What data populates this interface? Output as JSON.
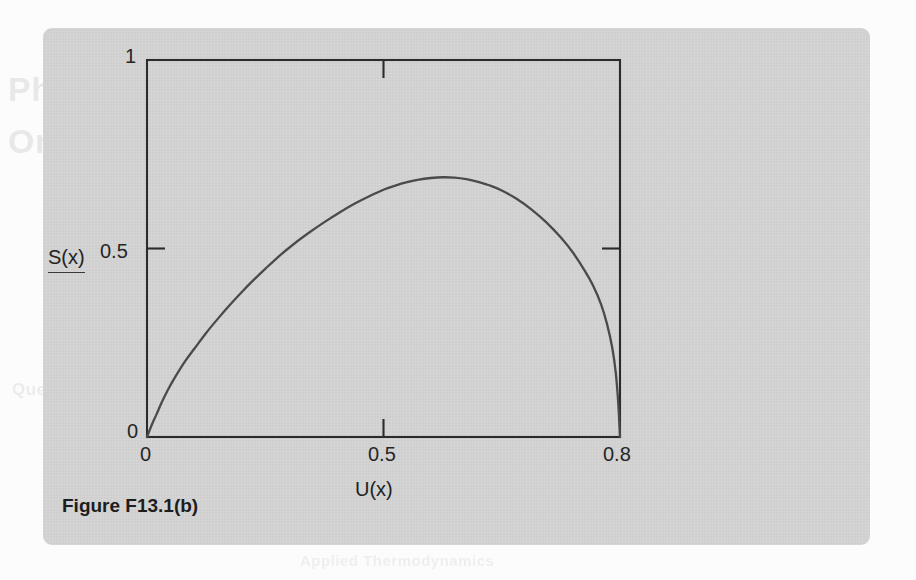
{
  "page": {
    "background_color": "#fdfdfd",
    "card_color": "#d4d4d4",
    "ghost_text": {
      "line_1": "Phase diagrams",
      "line_2": "One-component systems",
      "line_3": "Question 13.1",
      "line_4": "Applied Thermodynamics"
    }
  },
  "caption": {
    "text": "Figure F13.1(b)"
  },
  "chart_data": {
    "type": "line",
    "title": "",
    "subtitle": "",
    "xlabel": "U(x)",
    "ylabel": "S(x)",
    "xlim": [
      0,
      0.8
    ],
    "ylim": [
      0,
      1
    ],
    "grid": false,
    "legend": null,
    "axis_color": "#2b2b2b",
    "curve_color": "#4a4a4a",
    "xticks": [
      {
        "value": 0,
        "label": "0"
      },
      {
        "value": 0.5,
        "label": "0.5"
      },
      {
        "value": 0.8,
        "label": "0.8"
      }
    ],
    "yticks": [
      {
        "value": 0,
        "label": "0"
      },
      {
        "value": 0.5,
        "label": "0.5"
      },
      {
        "value": 1,
        "label": "1"
      }
    ],
    "tick_marks": {
      "top_center": 0.5,
      "right_middle": 0.5,
      "bottom_center": 0.5,
      "left_middle": 0.5
    },
    "series": [
      {
        "name": "S(x)",
        "x": [
          0.0,
          0.008,
          0.016,
          0.025,
          0.035,
          0.048,
          0.064,
          0.08,
          0.1,
          0.12,
          0.14,
          0.16,
          0.18,
          0.2,
          0.225,
          0.25,
          0.275,
          0.3,
          0.325,
          0.35,
          0.375,
          0.4,
          0.42,
          0.44,
          0.46,
          0.48,
          0.5,
          0.52,
          0.54,
          0.56,
          0.58,
          0.6,
          0.625,
          0.65,
          0.675,
          0.7,
          0.72,
          0.74,
          0.755,
          0.768,
          0.778,
          0.787,
          0.793,
          0.797,
          0.8
        ],
        "y": [
          0.0,
          0.032,
          0.06,
          0.092,
          0.124,
          0.16,
          0.2,
          0.234,
          0.276,
          0.314,
          0.35,
          0.384,
          0.416,
          0.446,
          0.482,
          0.514,
          0.543,
          0.57,
          0.595,
          0.618,
          0.638,
          0.656,
          0.667,
          0.676,
          0.683,
          0.687,
          0.689,
          0.688,
          0.684,
          0.677,
          0.667,
          0.654,
          0.632,
          0.604,
          0.57,
          0.529,
          0.49,
          0.442,
          0.4,
          0.352,
          0.3,
          0.236,
          0.168,
          0.09,
          0.0
        ]
      }
    ],
    "annotations": [
      {
        "text": "curve peaks near S(x) = 0.69 at U(x) = 0.5"
      }
    ]
  }
}
